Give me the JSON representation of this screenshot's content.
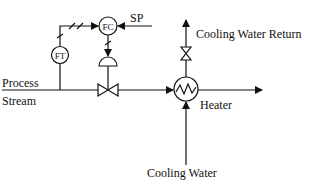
{
  "diagram": {
    "type": "process-control-pid",
    "labels": {
      "process_line1": "Process",
      "process_line2": "Stream",
      "setpoint": "SP",
      "cooling_water_return": "Cooling Water Return",
      "heater": "Heater",
      "cooling_water": "Cooling Water"
    },
    "instruments": {
      "flow_controller": "FC",
      "flow_transmitter": "FT"
    },
    "colors": {
      "line": "#111111",
      "background": "#ffffff"
    }
  }
}
